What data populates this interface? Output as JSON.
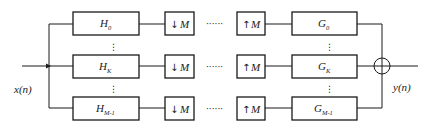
{
  "diagram": {
    "input_label": "x(n)",
    "output_label": "y(n)",
    "ellipsis_h": "······",
    "ellipsis_v": "⋮",
    "rows": [
      {
        "analysis": {
          "base": "H",
          "sub": "0"
        },
        "down": {
          "arrow": "↓",
          "factor": "M"
        },
        "up": {
          "arrow": "↑",
          "factor": "M"
        },
        "synthesis": {
          "base": "G",
          "sub": "0"
        }
      },
      {
        "analysis": {
          "base": "H",
          "sub": "K"
        },
        "down": {
          "arrow": "↓",
          "factor": "M"
        },
        "up": {
          "arrow": "↑",
          "factor": "M"
        },
        "synthesis": {
          "base": "G",
          "sub": "K"
        }
      },
      {
        "analysis": {
          "base": "H",
          "sub": "M-1"
        },
        "down": {
          "arrow": "↓",
          "factor": "M"
        },
        "up": {
          "arrow": "↑",
          "factor": "M"
        },
        "synthesis": {
          "base": "G",
          "sub": "M-1"
        }
      }
    ],
    "summing_node": "sum"
  }
}
